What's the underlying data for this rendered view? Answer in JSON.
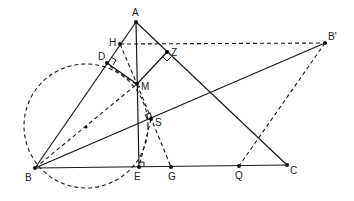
{
  "diagram": {
    "points": {
      "A": {
        "label": "A",
        "x": 136,
        "y": 22
      },
      "B": {
        "label": "B",
        "x": 35,
        "y": 168
      },
      "C": {
        "label": "C",
        "x": 287,
        "y": 165
      },
      "B_prime": {
        "label": "B'",
        "x": 325,
        "y": 43
      },
      "H": {
        "label": "H",
        "x": 120,
        "y": 44
      },
      "Z": {
        "label": "Z",
        "x": 167,
        "y": 52
      },
      "D": {
        "label": "D",
        "x": 107,
        "y": 63
      },
      "M": {
        "label": "M",
        "x": 137,
        "y": 84
      },
      "S": {
        "label": "S",
        "x": 151,
        "y": 119
      },
      "E": {
        "label": "E",
        "x": 139,
        "y": 167
      },
      "G": {
        "label": "G",
        "x": 171,
        "y": 167
      },
      "Q": {
        "label": "Q",
        "x": 239,
        "y": 166
      },
      "O": {
        "label": "",
        "x": 86,
        "y": 126
      }
    },
    "circle": {
      "cx": 86,
      "cy": 126,
      "r": 62,
      "style": "dashed"
    },
    "solid_segments": [
      "AB",
      "AC",
      "BC",
      "AE",
      "MZ",
      "BB'"
    ],
    "dashed_segments": [
      "HB'",
      "DM",
      "HM",
      "BM",
      "MG",
      "MS",
      "B'Q"
    ],
    "right_angles": [
      "D",
      "Z",
      "S",
      "E"
    ]
  }
}
